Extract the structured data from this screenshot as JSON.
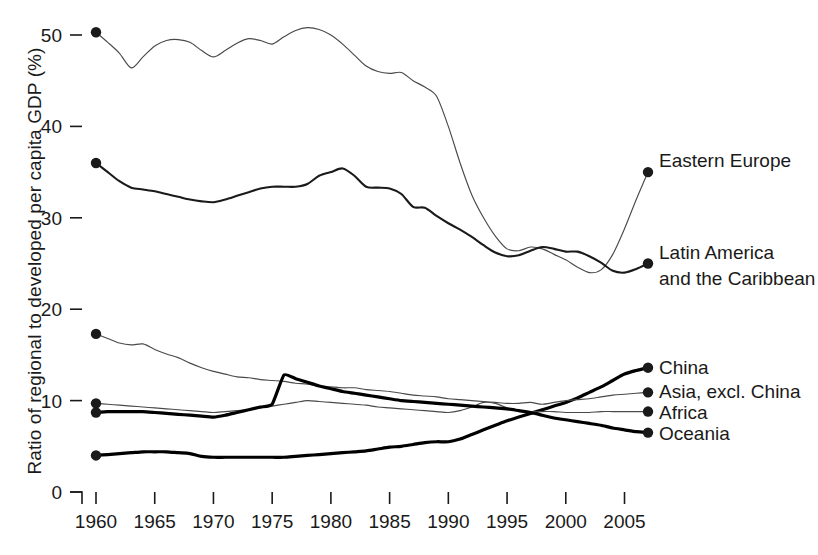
{
  "chart_data": {
    "type": "line",
    "title": "",
    "xlabel": "",
    "ylabel": "Ratio of regional to developed per capita GDP (%)",
    "xlim": [
      1960,
      2007
    ],
    "ylim": [
      0,
      52
    ],
    "xticks": [
      1960,
      1965,
      1970,
      1975,
      1980,
      1985,
      1990,
      1995,
      2000,
      2005
    ],
    "yticks": [
      0,
      10,
      20,
      30,
      40,
      50
    ],
    "grid": false,
    "legend_position": "right-inline-end-of-line",
    "marker": "filled-circle at first and last point",
    "series": [
      {
        "name": "Eastern Europe",
        "style": "thin",
        "x": [
          1960,
          1961,
          1962,
          1963,
          1964,
          1965,
          1966,
          1967,
          1968,
          1969,
          1970,
          1971,
          1972,
          1973,
          1974,
          1975,
          1976,
          1977,
          1978,
          1979,
          1980,
          1981,
          1982,
          1983,
          1984,
          1985,
          1986,
          1987,
          1988,
          1989,
          1990,
          1991,
          1992,
          1993,
          1994,
          1995,
          1996,
          1997,
          1998,
          1999,
          2000,
          2001,
          2002,
          2003,
          2004,
          2005,
          2006,
          2007
        ],
        "values": [
          50.3,
          49.2,
          48.0,
          46.4,
          47.6,
          48.8,
          49.4,
          49.5,
          49.2,
          48.3,
          47.6,
          48.3,
          49.1,
          49.6,
          49.4,
          49.0,
          49.8,
          50.5,
          50.8,
          50.6,
          50.0,
          49.0,
          47.8,
          46.6,
          46.0,
          45.8,
          45.9,
          45.0,
          44.3,
          43.3,
          40.0,
          36.0,
          32.5,
          30.0,
          28.0,
          26.6,
          26.4,
          26.8,
          26.6,
          26.0,
          25.4,
          24.6,
          24.0,
          24.3,
          26.0,
          28.8,
          32.0,
          35.0
        ]
      },
      {
        "name": "Latin America and the Caribbean",
        "label_lines": [
          "Latin America",
          "and the Caribbean"
        ],
        "style": "medium",
        "x": [
          1960,
          1961,
          1962,
          1963,
          1964,
          1965,
          1966,
          1967,
          1968,
          1969,
          1970,
          1971,
          1972,
          1973,
          1974,
          1975,
          1976,
          1977,
          1978,
          1979,
          1980,
          1981,
          1982,
          1983,
          1984,
          1985,
          1986,
          1987,
          1988,
          1989,
          1990,
          1991,
          1992,
          1993,
          1994,
          1995,
          1996,
          1997,
          1998,
          1999,
          2000,
          2001,
          2002,
          2003,
          2004,
          2005,
          2006,
          2007
        ],
        "values": [
          36.0,
          35.0,
          34.0,
          33.3,
          33.1,
          32.9,
          32.6,
          32.3,
          32.0,
          31.8,
          31.7,
          32.0,
          32.4,
          32.8,
          33.2,
          33.4,
          33.4,
          33.4,
          33.7,
          34.6,
          35.0,
          35.4,
          34.6,
          33.4,
          33.3,
          33.2,
          32.6,
          31.2,
          31.1,
          30.2,
          29.4,
          28.7,
          27.9,
          27.0,
          26.2,
          25.8,
          25.9,
          26.4,
          26.8,
          26.6,
          26.3,
          26.3,
          25.8,
          25.1,
          24.2,
          24.0,
          24.4,
          25.0
        ]
      },
      {
        "name": "China",
        "style": "thick",
        "x": [
          1960,
          1961,
          1962,
          1963,
          1964,
          1965,
          1966,
          1967,
          1968,
          1969,
          1970,
          1971,
          1972,
          1973,
          1974,
          1975,
          1976,
          1977,
          1978,
          1979,
          1980,
          1981,
          1982,
          1983,
          1984,
          1985,
          1986,
          1987,
          1988,
          1989,
          1990,
          1991,
          1992,
          1993,
          1994,
          1995,
          1996,
          1997,
          1998,
          1999,
          2000,
          2001,
          2002,
          2003,
          2004,
          2005,
          2006,
          2007
        ],
        "values": [
          4.0,
          4.1,
          4.2,
          4.3,
          4.4,
          4.4,
          4.4,
          4.3,
          4.2,
          3.9,
          3.8,
          3.8,
          3.8,
          3.8,
          3.8,
          3.8,
          3.8,
          3.9,
          4.0,
          4.1,
          4.2,
          4.3,
          4.4,
          4.5,
          4.7,
          4.9,
          5.0,
          5.2,
          5.4,
          5.5,
          5.5,
          5.8,
          6.3,
          6.8,
          7.3,
          7.8,
          8.2,
          8.6,
          9.0,
          9.4,
          9.8,
          10.3,
          10.9,
          11.5,
          12.2,
          12.9,
          13.3,
          13.6
        ]
      },
      {
        "name": "Asia, excl. China",
        "style": "thin",
        "x": [
          1960,
          1961,
          1962,
          1963,
          1964,
          1965,
          1966,
          1967,
          1968,
          1969,
          1970,
          1971,
          1972,
          1973,
          1974,
          1975,
          1976,
          1977,
          1978,
          1979,
          1980,
          1981,
          1982,
          1983,
          1984,
          1985,
          1986,
          1987,
          1988,
          1989,
          1990,
          1991,
          1992,
          1993,
          1994,
          1995,
          1996,
          1997,
          1998,
          1999,
          2000,
          2001,
          2002,
          2003,
          2004,
          2005,
          2006,
          2007
        ],
        "values": [
          17.3,
          16.8,
          16.3,
          16.1,
          16.2,
          15.6,
          15.1,
          14.7,
          14.1,
          13.6,
          13.2,
          12.9,
          12.6,
          12.5,
          12.3,
          12.2,
          12.1,
          11.9,
          11.8,
          11.6,
          11.5,
          11.4,
          11.4,
          11.2,
          11.1,
          11.0,
          10.8,
          10.6,
          10.5,
          10.4,
          10.2,
          10.1,
          10.0,
          9.9,
          9.8,
          9.7,
          9.7,
          9.8,
          9.6,
          9.8,
          10.0,
          10.1,
          10.2,
          10.4,
          10.6,
          10.7,
          10.8,
          10.9
        ]
      },
      {
        "name": "Africa",
        "style": "thin",
        "x": [
          1960,
          1961,
          1962,
          1963,
          1964,
          1965,
          1966,
          1967,
          1968,
          1969,
          1970,
          1971,
          1972,
          1973,
          1974,
          1975,
          1976,
          1977,
          1978,
          1979,
          1980,
          1981,
          1982,
          1983,
          1984,
          1985,
          1986,
          1987,
          1988,
          1989,
          1990,
          1991,
          1992,
          1993,
          1994,
          1995,
          1996,
          1997,
          1998,
          1999,
          2000,
          2001,
          2002,
          2003,
          2004,
          2005,
          2006,
          2007
        ],
        "values": [
          9.7,
          9.6,
          9.5,
          9.4,
          9.3,
          9.2,
          9.1,
          9.0,
          8.9,
          8.8,
          8.7,
          8.8,
          8.9,
          9.0,
          9.2,
          9.4,
          9.6,
          9.8,
          10.0,
          9.9,
          9.8,
          9.7,
          9.6,
          9.5,
          9.3,
          9.2,
          9.1,
          9.0,
          8.9,
          8.8,
          8.7,
          8.9,
          9.3,
          9.8,
          9.7,
          9.2,
          8.9,
          8.8,
          8.8,
          8.8,
          8.7,
          8.7,
          8.7,
          8.8,
          8.8,
          8.8,
          8.8,
          8.8
        ]
      },
      {
        "name": "Oceania",
        "style": "thick",
        "x": [
          1960,
          1961,
          1962,
          1963,
          1964,
          1965,
          1966,
          1967,
          1968,
          1969,
          1970,
          1971,
          1972,
          1973,
          1974,
          1975,
          1976,
          1977,
          1978,
          1979,
          1980,
          1981,
          1982,
          1983,
          1984,
          1985,
          1986,
          1987,
          1988,
          1989,
          1990,
          1991,
          1992,
          1993,
          1994,
          1995,
          1996,
          1997,
          1998,
          1999,
          2000,
          2001,
          2002,
          2003,
          2004,
          2005,
          2006,
          2007
        ],
        "values": [
          8.7,
          8.8,
          8.8,
          8.8,
          8.8,
          8.7,
          8.6,
          8.5,
          8.4,
          8.3,
          8.2,
          8.4,
          8.7,
          9.0,
          9.3,
          9.6,
          12.8,
          12.4,
          12.0,
          11.6,
          11.3,
          11.0,
          10.8,
          10.6,
          10.4,
          10.2,
          10.0,
          9.9,
          9.8,
          9.7,
          9.6,
          9.5,
          9.4,
          9.3,
          9.2,
          9.1,
          8.9,
          8.7,
          8.4,
          8.1,
          7.9,
          7.7,
          7.5,
          7.3,
          7.0,
          6.8,
          6.6,
          6.5
        ]
      }
    ]
  },
  "axis": {
    "y_title": "Ratio of regional to developed per capita GDP (%)",
    "y_tick_labels": [
      "50",
      "40",
      "30",
      "20",
      "10",
      "0"
    ],
    "x_tick_labels": [
      "1960",
      "1965",
      "1970",
      "1975",
      "1980",
      "1985",
      "1990",
      "1995",
      "2000",
      "2005"
    ]
  },
  "labels": {
    "eastern_europe": "Eastern Europe",
    "latin_america_1": "Latin America",
    "latin_america_2": "and the Caribbean",
    "china": "China",
    "asia": "Asia, excl. China",
    "africa": "Africa",
    "oceania": "Oceania"
  },
  "colors": {
    "ink": "#1a1a1a",
    "line_thin": "#4a4a4a",
    "line_medium": "#1a1a1a",
    "line_thick": "#000000",
    "background": "#ffffff"
  }
}
